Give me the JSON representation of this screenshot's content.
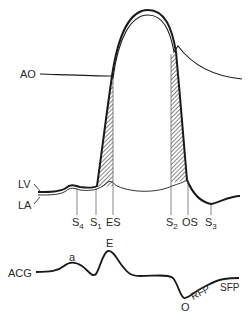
{
  "diagram": {
    "type": "physiology-timing-diagram",
    "colors": {
      "stroke": "#1a1a1a",
      "hatch": "#555555",
      "background": "#ffffff"
    },
    "traces": {
      "ao": {
        "label": "AO",
        "description": "Aortic pressure"
      },
      "lv": {
        "label": "LV",
        "description": "Left ventricular pressure"
      },
      "la": {
        "label": "LA",
        "description": "Left atrial pressure"
      },
      "acg": {
        "label": "ACG",
        "description": "Apexcardiogram"
      }
    },
    "events": [
      {
        "id": "s4",
        "base": "S",
        "sub": "4"
      },
      {
        "id": "s1",
        "base": "S",
        "sub": "1"
      },
      {
        "id": "es",
        "base": "ES",
        "sub": ""
      },
      {
        "id": "s2",
        "base": "S",
        "sub": "2"
      },
      {
        "id": "os",
        "base": "OS",
        "sub": ""
      },
      {
        "id": "s3",
        "base": "S",
        "sub": "3"
      }
    ],
    "acg_points": {
      "a": "a",
      "e": "E",
      "o": "O",
      "rfp": "RFP",
      "sfp": "SFP"
    }
  }
}
